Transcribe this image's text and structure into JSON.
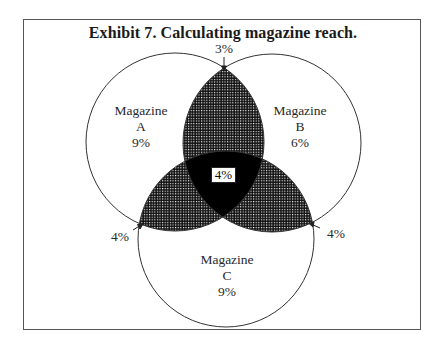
{
  "title": "Exhibit 7.  Calculating magazine reach.",
  "circles": {
    "a": {
      "name": "Magazine",
      "letter": "A",
      "value": "9%"
    },
    "b": {
      "name": "Magazine",
      "letter": "B",
      "value": "6%"
    },
    "c": {
      "name": "Magazine",
      "letter": "C",
      "value": "9%"
    }
  },
  "overlaps": {
    "ab": "3%",
    "ac": "4%",
    "bc": "4%",
    "abc": "4%"
  },
  "colors": {
    "outline": "#333333",
    "frame": "#555555",
    "hatch": "#111111",
    "triple": "#000000"
  }
}
